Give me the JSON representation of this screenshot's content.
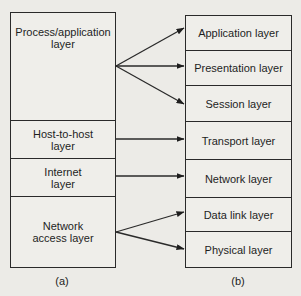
{
  "diagram": {
    "left": {
      "caption": "(a)",
      "title": "TCP/IP model",
      "layers": [
        {
          "label": "Process/application layer"
        },
        {
          "label": "Host-to-host layer"
        },
        {
          "label": "Internet layer"
        },
        {
          "label": "Network access layer"
        }
      ]
    },
    "right": {
      "caption": "(b)",
      "title": "OSI model",
      "layers": [
        {
          "label": "Application layer"
        },
        {
          "label": "Presentation layer"
        },
        {
          "label": "Session layer"
        },
        {
          "label": "Transport layer"
        },
        {
          "label": "Network layer"
        },
        {
          "label": "Data link layer"
        },
        {
          "label": "Physical layer"
        }
      ]
    },
    "mappings": [
      {
        "from": "Process/application layer",
        "to": [
          "Application layer",
          "Presentation layer",
          "Session layer"
        ]
      },
      {
        "from": "Host-to-host layer",
        "to": [
          "Transport layer"
        ]
      },
      {
        "from": "Internet layer",
        "to": [
          "Network layer"
        ]
      },
      {
        "from": "Network access layer",
        "to": [
          "Data link layer",
          "Physical layer"
        ]
      }
    ],
    "colors": {
      "line": "#2a2a2a",
      "background": "#ecebe7"
    }
  },
  "labels": {
    "l0a": "Process/application",
    "l0b": "layer",
    "l1a": "Host-to-host",
    "l1b": "layer",
    "l2a": "Internet",
    "l2b": "layer",
    "l3a": "Network",
    "l3b": "access layer"
  }
}
